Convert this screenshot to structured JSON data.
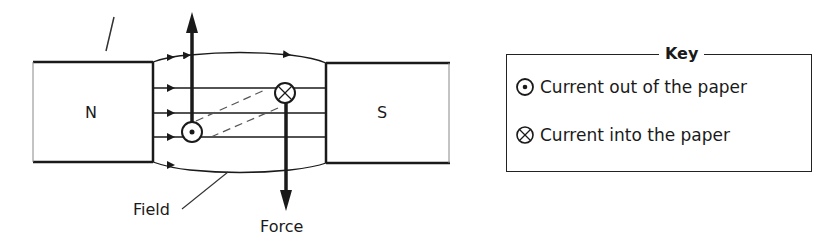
{
  "diagram": {
    "magnets": {
      "north_label": "N",
      "south_label": "S"
    },
    "labels": {
      "field": "Field",
      "force": "Force"
    },
    "conductors": [
      {
        "symbol": "dot-circle",
        "meaning": "current out of the paper",
        "force_direction": "up"
      },
      {
        "symbol": "cross-circle",
        "meaning": "current into the paper",
        "force_direction": "down"
      }
    ],
    "field_direction": "N to S (left to right)"
  },
  "key": {
    "title": "Key",
    "items": [
      {
        "icon": "dot-circle-icon",
        "label": "Current out of the paper"
      },
      {
        "icon": "cross-circle-icon",
        "label": "Current into the paper"
      }
    ]
  }
}
